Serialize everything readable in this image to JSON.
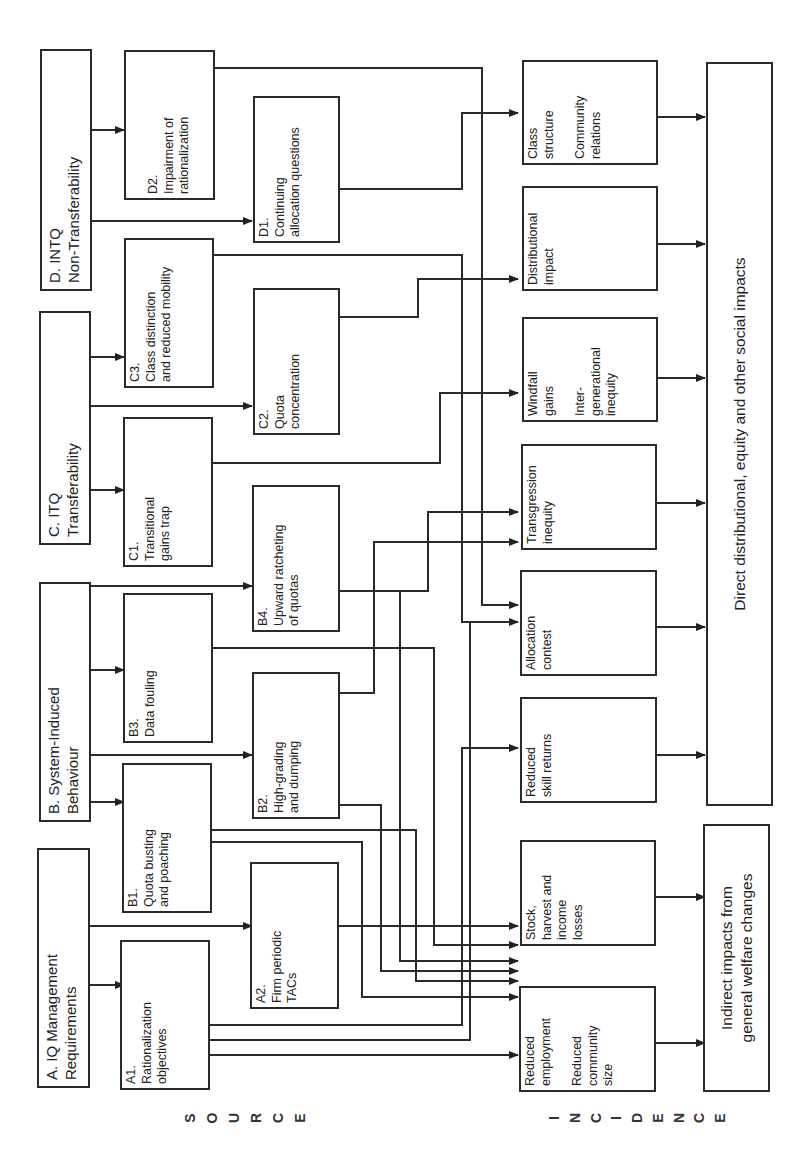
{
  "sources": {
    "A": {
      "label": "A.   IQ Management\n       Requirements"
    },
    "B": {
      "label": "B.   System-Induced\n       Behaviour"
    },
    "C": {
      "label": "C.  ITQ\n      Transferability"
    },
    "D": {
      "label": "D.   INTQ\n       Non-Transferability"
    }
  },
  "nodes": {
    "A1": {
      "label": "A1.\nRationalization\nobjectives"
    },
    "A2": {
      "label": "A2.\nFirm periodic\nTACs"
    },
    "B1": {
      "label": "B1.\nQuota busting\nand poaching"
    },
    "B2": {
      "label": "B2.\nHigh-grading\nand dumping"
    },
    "B3": {
      "label": "B3.\nData fouling"
    },
    "B4": {
      "label": "B4.\nUpward ratcheting\nof quotas"
    },
    "C1": {
      "label": "C1.\nTransitional\ngains trap"
    },
    "C2": {
      "label": "C2.\nQuota\nconcentration"
    },
    "C3": {
      "label": "C3.\nClass distinction\nand reduced mobility"
    },
    "D1": {
      "label": "D1.\nContinuing\nallocation questions"
    },
    "D2": {
      "label": "D2.\nImpairment of\nrationalization"
    }
  },
  "incidence": {
    "employment": {
      "label": "Reduced\nemployment\n\nReduced\ncommunity\nsize"
    },
    "stock": {
      "label": "Stock,\nharvest and\nincome\nlosses"
    },
    "skill": {
      "label": "Reduced\nskill returns"
    },
    "allocation": {
      "label": "Allocation\ncontest"
    },
    "transgression": {
      "label": "Transgression\ninequity"
    },
    "windfall": {
      "label": "Windfall\ngains\n\nInter-\ngenerational\ninequity"
    },
    "distributional": {
      "label": "Distributional\nimpact"
    },
    "class": {
      "label": "Class\nstructure\n\nCommunity\nrelations"
    }
  },
  "outcomes": {
    "indirect": {
      "label": "Indirect impacts from\ngeneral welfare changes"
    },
    "direct": {
      "label": "Direct distributional, equity and other social impacts"
    }
  },
  "axis_labels": {
    "source": [
      "S",
      "O",
      "U",
      "R",
      "C",
      "E"
    ],
    "incidence": [
      "I",
      "N",
      "C",
      "I",
      "D",
      "E",
      "N",
      "C",
      "E"
    ]
  }
}
